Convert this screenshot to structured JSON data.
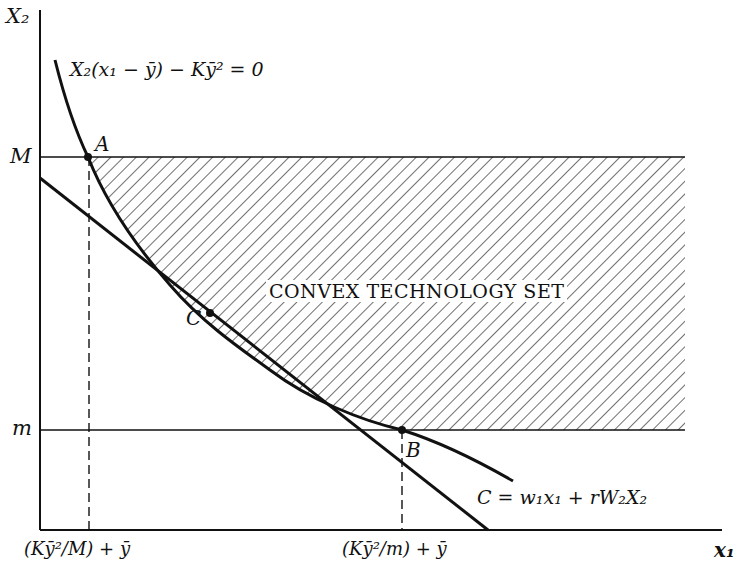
{
  "figure": {
    "type": "economics diagram",
    "axes": {
      "y_label": "X₂",
      "x_label": "x₁"
    },
    "y_ticks": [
      {
        "label": "M",
        "meaning": "upper bound on X2"
      },
      {
        "label": "m",
        "meaning": "lower bound on X2"
      }
    ],
    "x_ticks": [
      {
        "label": "(Kȳ²/M) + ȳ",
        "at_point": "A"
      },
      {
        "label": "(Kȳ²/m) + ȳ",
        "at_point": "B"
      }
    ],
    "curve_label": "X₂(x₁ − ȳ) − Kȳ² = 0",
    "line_label": "C = w₁x₁ + rW₂X₂",
    "region_label": "CONVEX TECHNOLOGY SET",
    "points": [
      {
        "name": "A",
        "label": "A"
      },
      {
        "name": "B",
        "label": "B"
      },
      {
        "name": "C",
        "label": "C"
      }
    ]
  },
  "colors": {
    "ink": "#111111",
    "background": "#ffffff"
  }
}
